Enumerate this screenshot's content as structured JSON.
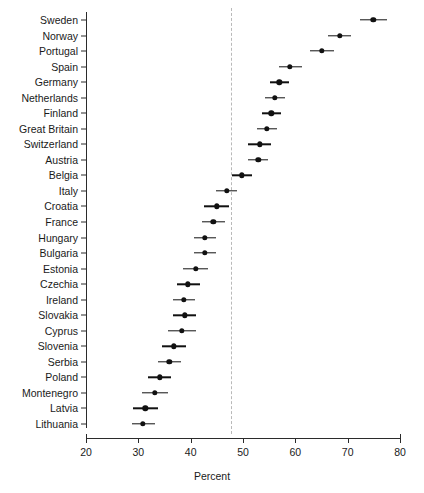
{
  "chart_data": {
    "type": "scatter",
    "title": "",
    "subtitle": "",
    "xlabel": "Percent",
    "ylabel": "",
    "xlim": [
      20,
      80
    ],
    "xticks": [
      20,
      30,
      40,
      50,
      60,
      70,
      80
    ],
    "grid": false,
    "legend": false,
    "orientation": "horizontal",
    "marker": "filled-circle-with-error-bars",
    "reference_line": {
      "value": 47.7,
      "style": "dashed",
      "color": "#b9b9b9"
    },
    "categories": [
      "Sweden",
      "Norway",
      "Portugal",
      "Spain",
      "Germany",
      "Netherlands",
      "Finland",
      "Great Britain",
      "Switzerland",
      "Austria",
      "Belgia",
      "Italy",
      "Croatia",
      "France",
      "Hungary",
      "Bulgaria",
      "Estonia",
      "Czechia",
      "Ireland",
      "Slovakia",
      "Cyprus",
      "Slovenia",
      "Serbia",
      "Poland",
      "Montenegro",
      "Latvia",
      "Lithuania"
    ],
    "values": [
      74.9,
      68.5,
      65.1,
      59.0,
      56.9,
      56.1,
      55.4,
      54.6,
      53.2,
      52.9,
      49.8,
      46.9,
      45.0,
      44.3,
      42.7,
      42.7,
      41.0,
      39.5,
      38.7,
      38.9,
      38.3,
      36.8,
      35.9,
      34.1,
      33.2,
      31.3,
      30.9
    ],
    "ci_low": [
      72.4,
      66.3,
      62.8,
      56.8,
      55.1,
      54.2,
      53.6,
      52.7,
      50.9,
      51.0,
      47.9,
      44.9,
      42.6,
      42.1,
      40.6,
      40.7,
      38.6,
      37.4,
      36.7,
      36.6,
      35.6,
      34.5,
      33.8,
      31.9,
      30.7,
      28.9,
      28.7
    ],
    "ci_high": [
      77.5,
      70.7,
      67.4,
      61.2,
      58.7,
      58.0,
      57.2,
      56.5,
      55.4,
      54.8,
      51.7,
      48.9,
      47.3,
      46.5,
      44.8,
      44.8,
      43.3,
      41.7,
      40.8,
      41.1,
      41.0,
      39.1,
      38.1,
      36.3,
      35.6,
      33.7,
      33.1
    ]
  },
  "axis": {
    "x_title": "Percent",
    "tick_labels": [
      "20",
      "30",
      "40",
      "50",
      "60",
      "70",
      "80"
    ]
  }
}
